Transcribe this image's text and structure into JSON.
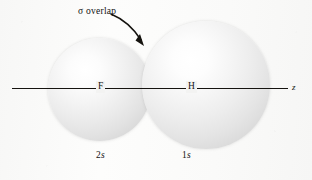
{
  "figure": {
    "background_color": "#fbfbfa",
    "line_color": "#15130f"
  },
  "annotation": {
    "sigma_symbol": "σ",
    "overlap_label": "overlap",
    "full_label": "σ overlap",
    "arrow": "curved-arrow-down-right"
  },
  "axis": {
    "label": "z",
    "atoms": [
      {
        "symbol": "F",
        "name": "fluorine"
      },
      {
        "symbol": "H",
        "name": "hydrogen"
      }
    ]
  },
  "orbitals": [
    {
      "atom": "F",
      "caption_number": "2",
      "caption_letter": "s",
      "caption": "2s",
      "shade": "#e2e2e2"
    },
    {
      "atom": "H",
      "caption_number": "1",
      "caption_letter": "s",
      "caption": "1s",
      "shade": "#e4e4e4"
    }
  ]
}
